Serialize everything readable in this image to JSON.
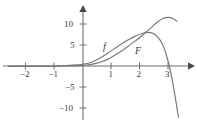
{
  "figure": {
    "background_color": "#ffffff",
    "axis_color": "#6e6e6e",
    "curve_color": "#7a7a7a",
    "text_color": "#3a3a3a"
  },
  "axes": {
    "x_label": "",
    "y_label": "",
    "x_ticks": [
      {
        "value": -2,
        "label": "−2"
      },
      {
        "value": -1,
        "label": "−1"
      },
      {
        "value": 1,
        "label": "1"
      },
      {
        "value": 2,
        "label": "2"
      },
      {
        "value": 3,
        "label": "3"
      }
    ],
    "y_ticks": [
      {
        "value": 10,
        "label": "10"
      },
      {
        "value": 5,
        "label": "5"
      },
      {
        "value": -5,
        "label": "−5"
      },
      {
        "value": -10,
        "label": "−10"
      }
    ],
    "x_arrow": "right-arrowhead",
    "y_arrow": "up-arrowhead"
  },
  "labels": {
    "f": "f",
    "F": "F"
  },
  "chart_data": {
    "type": "line",
    "xlabel": "",
    "ylabel": "",
    "xlim": [
      -2.6,
      3.4
    ],
    "ylim": [
      -12.5,
      12.5
    ],
    "grid": false,
    "legend": "inline-curve-labels",
    "x_ticks": [
      -2,
      -1,
      1,
      2,
      3
    ],
    "y_ticks": [
      -10,
      -5,
      5,
      10
    ],
    "series": [
      {
        "name": "f",
        "label_position": {
          "x": 0.78,
          "y": 4.4
        },
        "points": [
          {
            "x": -2.6,
            "y": -0.05
          },
          {
            "x": -2.2,
            "y": -0.05
          },
          {
            "x": -1.8,
            "y": -0.05
          },
          {
            "x": -1.4,
            "y": -0.05
          },
          {
            "x": -1.0,
            "y": 0.0
          },
          {
            "x": -0.6,
            "y": 0.1
          },
          {
            "x": -0.2,
            "y": 0.25
          },
          {
            "x": 0.0,
            "y": 0.4
          },
          {
            "x": 0.3,
            "y": 0.9
          },
          {
            "x": 0.6,
            "y": 1.9
          },
          {
            "x": 0.9,
            "y": 3.2
          },
          {
            "x": 1.2,
            "y": 4.6
          },
          {
            "x": 1.5,
            "y": 5.9
          },
          {
            "x": 1.8,
            "y": 7.0
          },
          {
            "x": 2.1,
            "y": 7.8
          },
          {
            "x": 2.3,
            "y": 8.0
          },
          {
            "x": 2.5,
            "y": 7.6
          },
          {
            "x": 2.7,
            "y": 6.2
          },
          {
            "x": 2.85,
            "y": 4.2
          },
          {
            "x": 3.0,
            "y": 0.8
          },
          {
            "x": 3.05,
            "y": -0.6
          },
          {
            "x": 3.15,
            "y": -4.0
          },
          {
            "x": 3.25,
            "y": -8.0
          },
          {
            "x": 3.35,
            "y": -12.2
          }
        ]
      },
      {
        "name": "F",
        "label_position": {
          "x": 1.9,
          "y": 3.4
        },
        "points": [
          {
            "x": -2.6,
            "y": -0.1
          },
          {
            "x": -2.2,
            "y": -0.1
          },
          {
            "x": -1.8,
            "y": -0.1
          },
          {
            "x": -1.4,
            "y": -0.1
          },
          {
            "x": -1.0,
            "y": -0.05
          },
          {
            "x": -0.6,
            "y": 0.0
          },
          {
            "x": -0.2,
            "y": 0.05
          },
          {
            "x": 0.0,
            "y": 0.15
          },
          {
            "x": 0.3,
            "y": 0.4
          },
          {
            "x": 0.6,
            "y": 0.9
          },
          {
            "x": 0.9,
            "y": 1.7
          },
          {
            "x": 1.2,
            "y": 2.9
          },
          {
            "x": 1.5,
            "y": 4.3
          },
          {
            "x": 1.8,
            "y": 5.8
          },
          {
            "x": 2.1,
            "y": 7.4
          },
          {
            "x": 2.4,
            "y": 9.2
          },
          {
            "x": 2.6,
            "y": 10.4
          },
          {
            "x": 2.8,
            "y": 11.3
          },
          {
            "x": 3.0,
            "y": 11.6
          },
          {
            "x": 3.15,
            "y": 11.3
          },
          {
            "x": 3.3,
            "y": 10.6
          }
        ]
      }
    ],
    "annotations": [
      {
        "text": "f",
        "x": 0.78,
        "y": 4.4
      },
      {
        "text": "F",
        "x": 1.9,
        "y": 3.4
      }
    ]
  }
}
